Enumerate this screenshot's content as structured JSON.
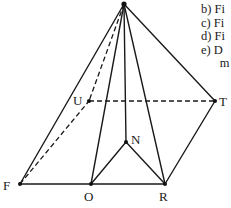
{
  "figure": {
    "type": "pyramid",
    "vertices": {
      "apex": {
        "label": "",
        "x": 124,
        "y": 4
      },
      "U": {
        "label": "U",
        "x": 89,
        "y": 101
      },
      "T": {
        "label": "T",
        "x": 215,
        "y": 101
      },
      "N": {
        "label": "N",
        "x": 126,
        "y": 142
      },
      "F": {
        "label": "F",
        "x": 20,
        "y": 184
      },
      "O": {
        "label": "O",
        "x": 91,
        "y": 184
      },
      "R": {
        "label": "R",
        "x": 165,
        "y": 184
      }
    },
    "solid_edges": [
      [
        "apex",
        "F"
      ],
      [
        "apex",
        "O"
      ],
      [
        "apex",
        "N"
      ],
      [
        "apex",
        "R"
      ],
      [
        "apex",
        "T"
      ],
      [
        "F",
        "O"
      ],
      [
        "O",
        "R"
      ],
      [
        "O",
        "N"
      ],
      [
        "N",
        "R"
      ],
      [
        "R",
        "T"
      ]
    ],
    "dashed_edges": [
      [
        "apex",
        "U"
      ],
      [
        "F",
        "U"
      ],
      [
        "U",
        "T"
      ]
    ]
  },
  "labels": {
    "U": "U",
    "T": "T",
    "N": "N",
    "F": "F",
    "O": "O",
    "R": "R"
  },
  "side_text": [
    "b)  Fi",
    "c)  Fi",
    "d)  Fi",
    "e)  D",
    "      m"
  ]
}
